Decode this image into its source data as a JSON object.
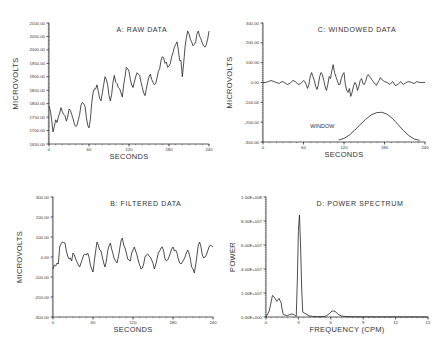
{
  "chart_data": [
    {
      "id": "A",
      "type": "line",
      "title": "A: RAW DATA",
      "xlabel": "SECONDS",
      "ylabel": "MICROVOLTS",
      "xlim": [
        0,
        240
      ],
      "ylim": [
        1650,
        2100
      ],
      "xticks": [
        0,
        60,
        120,
        180,
        240
      ],
      "xtick_labels": [
        "0",
        "60",
        "120",
        "180",
        "240"
      ],
      "yticks": [
        1650,
        1700,
        1750,
        1800,
        1850,
        1900,
        1950,
        2000,
        2050,
        2100
      ],
      "ytick_labels": [
        "1650.00",
        "1700.00",
        "1750.00",
        "1800.00",
        "1850.00",
        "1900.00",
        "1950.00",
        "2000.00",
        "2050.00",
        "2100.00"
      ],
      "grid": false,
      "series": [
        {
          "name": "raw",
          "x": [
            0,
            2,
            4,
            6,
            8,
            10,
            12,
            14,
            16,
            18,
            20,
            22,
            24,
            26,
            28,
            30,
            32,
            34,
            36,
            38,
            40,
            42,
            44,
            46,
            48,
            50,
            52,
            54,
            56,
            58,
            60,
            62,
            64,
            66,
            68,
            70,
            72,
            74,
            76,
            78,
            80,
            82,
            84,
            86,
            88,
            90,
            92,
            94,
            96,
            98,
            100,
            102,
            104,
            106,
            108,
            110,
            112,
            114,
            116,
            118,
            120,
            122,
            124,
            126,
            128,
            130,
            132,
            134,
            136,
            138,
            140,
            142,
            144,
            146,
            148,
            150,
            152,
            154,
            156,
            158,
            160,
            162,
            164,
            166,
            168,
            170,
            172,
            174,
            176,
            178,
            180,
            182,
            184,
            186,
            188,
            190,
            192,
            194,
            196,
            198,
            200,
            202,
            204,
            206,
            208,
            210,
            212,
            214,
            216,
            218,
            220,
            222,
            224,
            226,
            228,
            230,
            232,
            234,
            236,
            238,
            240
          ],
          "values": [
            1790,
            1775,
            1740,
            1695,
            1715,
            1740,
            1730,
            1750,
            1765,
            1785,
            1770,
            1760,
            1755,
            1735,
            1750,
            1780,
            1775,
            1760,
            1745,
            1725,
            1715,
            1720,
            1740,
            1760,
            1795,
            1805,
            1800,
            1790,
            1750,
            1720,
            1710,
            1740,
            1800,
            1840,
            1855,
            1855,
            1870,
            1845,
            1820,
            1810,
            1840,
            1870,
            1900,
            1890,
            1870,
            1830,
            1810,
            1835,
            1880,
            1905,
            1880,
            1875,
            1860,
            1855,
            1840,
            1825,
            1870,
            1900,
            1935,
            1930,
            1920,
            1890,
            1870,
            1860,
            1880,
            1900,
            1915,
            1910,
            1905,
            1880,
            1860,
            1840,
            1830,
            1855,
            1880,
            1900,
            1910,
            1890,
            1880,
            1870,
            1875,
            1895,
            1920,
            1930,
            1960,
            1975,
            1970,
            1950,
            1955,
            1935,
            1940,
            1950,
            1975,
            1990,
            2010,
            2020,
            2030,
            2000,
            1960,
            1960,
            1900,
            1950,
            2010,
            2045,
            2070,
            2060,
            2040,
            2030,
            2015,
            2020,
            2030,
            2060,
            2070,
            2050,
            2040,
            2025,
            2015,
            2010,
            2020,
            2040,
            2070
          ]
        }
      ]
    },
    {
      "id": "B",
      "type": "line",
      "title": "B: FILTERED DATA",
      "xlabel": "SECONDS",
      "ylabel": "MICROVOLTS",
      "xlim": [
        0,
        240
      ],
      "ylim": [
        -300,
        300
      ],
      "xticks": [
        0,
        60,
        120,
        180,
        240
      ],
      "xtick_labels": [
        "0",
        "60",
        "120",
        "180",
        "240"
      ],
      "yticks": [
        -300,
        -200,
        -100,
        0,
        100,
        200,
        300
      ],
      "ytick_labels": [
        "-300.00",
        "-200.00",
        "-100.00",
        "0.00",
        "100.00",
        "200.00",
        "300.00"
      ],
      "grid": false,
      "series": [
        {
          "name": "filtered",
          "x": [
            0,
            2,
            4,
            6,
            8,
            10,
            12,
            14,
            16,
            18,
            20,
            22,
            24,
            26,
            28,
            30,
            32,
            34,
            36,
            38,
            40,
            42,
            44,
            46,
            48,
            50,
            52,
            54,
            56,
            58,
            60,
            62,
            64,
            66,
            68,
            70,
            72,
            74,
            76,
            78,
            80,
            82,
            84,
            86,
            88,
            90,
            92,
            94,
            96,
            98,
            100,
            102,
            104,
            106,
            108,
            110,
            112,
            114,
            116,
            118,
            120,
            122,
            124,
            126,
            128,
            130,
            132,
            134,
            136,
            138,
            140,
            142,
            144,
            146,
            148,
            150,
            152,
            154,
            156,
            158,
            160,
            162,
            164,
            166,
            168,
            170,
            172,
            174,
            176,
            178,
            180,
            182,
            184,
            186,
            188,
            190,
            192,
            194,
            196,
            198,
            200,
            202,
            204,
            206,
            208,
            210,
            212,
            214,
            216,
            218,
            220,
            222,
            224,
            226,
            228,
            230,
            232,
            234,
            236,
            238,
            240
          ],
          "values": [
            -60,
            -40,
            -45,
            -30,
            -35,
            50,
            65,
            75,
            72,
            70,
            30,
            5,
            -10,
            -5,
            -20,
            20,
            10,
            -10,
            -25,
            -40,
            -50,
            -30,
            -10,
            10,
            15,
            10,
            20,
            0,
            -40,
            -60,
            -75,
            -20,
            30,
            75,
            60,
            35,
            30,
            0,
            -30,
            -50,
            -20,
            30,
            55,
            70,
            40,
            15,
            -10,
            -20,
            -30,
            0,
            40,
            80,
            95,
            60,
            45,
            20,
            -10,
            -15,
            -20,
            20,
            35,
            50,
            30,
            10,
            -20,
            -40,
            -60,
            -55,
            -35,
            0,
            10,
            15,
            5,
            0,
            -15,
            -30,
            -60,
            -40,
            -10,
            20,
            30,
            45,
            50,
            30,
            -10,
            -20,
            -15,
            0,
            20,
            40,
            50,
            30,
            35,
            20,
            -10,
            -30,
            -35,
            -25,
            -15,
            0,
            20,
            35,
            20,
            -10,
            -50,
            -60,
            -80,
            -40,
            10,
            60,
            75,
            50,
            10,
            -5,
            0,
            10,
            30,
            50,
            60,
            55,
            50,
            30,
            20
          ]
        }
      ]
    },
    {
      "id": "C",
      "type": "line",
      "title": "C: WINDOWED DATA",
      "xlabel": "SECONDS",
      "ylabel": "MICROVOLTS",
      "xlim": [
        0,
        240
      ],
      "ylim": [
        -300,
        300
      ],
      "xticks": [
        0,
        60,
        120,
        180,
        240
      ],
      "xtick_labels": [
        "0",
        "60",
        "120",
        "180",
        "240"
      ],
      "yticks": [
        -300,
        -200,
        -100,
        0,
        100,
        200,
        300
      ],
      "ytick_labels": [
        "-300.00",
        "-200.00",
        "-100.00",
        "0.00",
        "100.00",
        "200.00",
        "300.00"
      ],
      "grid": false,
      "annotations": [
        {
          "text": "WINDOW",
          "x": 70,
          "y": -228
        }
      ],
      "series": [
        {
          "name": "windowed",
          "x": [
            0,
            4,
            8,
            12,
            16,
            20,
            24,
            28,
            32,
            36,
            40,
            44,
            48,
            52,
            56,
            60,
            62,
            64,
            66,
            68,
            70,
            72,
            74,
            76,
            78,
            80,
            82,
            84,
            86,
            88,
            90,
            92,
            94,
            96,
            98,
            100,
            102,
            104,
            106,
            108,
            110,
            112,
            114,
            116,
            118,
            120,
            122,
            124,
            126,
            128,
            130,
            132,
            134,
            136,
            138,
            140,
            142,
            144,
            146,
            148,
            150,
            152,
            154,
            156,
            158,
            160,
            162,
            164,
            166,
            168,
            170,
            172,
            174,
            176,
            178,
            180,
            184,
            188,
            192,
            196,
            200,
            204,
            208,
            212,
            216,
            220,
            224,
            228,
            232,
            236,
            240
          ],
          "values": [
            0,
            0,
            5,
            10,
            5,
            0,
            -5,
            5,
            0,
            -10,
            -5,
            10,
            5,
            -10,
            -5,
            10,
            5,
            -10,
            -30,
            -10,
            30,
            50,
            30,
            10,
            -20,
            -35,
            -10,
            30,
            50,
            40,
            10,
            -20,
            -40,
            -10,
            30,
            20,
            60,
            90,
            50,
            30,
            10,
            -10,
            -10,
            20,
            40,
            50,
            -10,
            -40,
            -50,
            -30,
            -70,
            -50,
            -20,
            0,
            -10,
            -40,
            -20,
            10,
            20,
            -5,
            -10,
            5,
            30,
            40,
            30,
            20,
            10,
            0,
            -5,
            -15,
            0,
            10,
            25,
            15,
            10,
            5,
            0,
            -10,
            5,
            -15,
            -10,
            5,
            -10,
            0,
            5,
            0,
            -5,
            5,
            0,
            0,
            0
          ]
        },
        {
          "name": "window",
          "x": [
            112,
            120,
            128,
            136,
            144,
            152,
            160,
            168,
            176,
            184,
            192,
            200,
            208,
            216,
            224,
            232
          ],
          "values": [
            -290,
            -282,
            -265,
            -240,
            -212,
            -186,
            -164,
            -152,
            -150,
            -160,
            -182,
            -212,
            -242,
            -268,
            -285,
            -292
          ]
        }
      ]
    },
    {
      "id": "D",
      "type": "line",
      "title": "D: POWER SPECTRUM",
      "xlabel": "FREQUENCY (CPM)",
      "ylabel": "POWER",
      "xlim": [
        0,
        15
      ],
      "ylim": [
        0,
        100000000
      ],
      "xticks": [
        0,
        3,
        6,
        9,
        12,
        15
      ],
      "xtick_labels": [
        "0",
        "3",
        "6",
        "9",
        "12",
        "15"
      ],
      "yticks": [
        0,
        20000000,
        40000000,
        60000000,
        80000000,
        100000000
      ],
      "ytick_labels": [
        "0.00E+000",
        "2.00E+007",
        "4.00E+007",
        "6.00E+007",
        "8.00E+007",
        "1.00E+008"
      ],
      "grid": false,
      "series": [
        {
          "name": "power",
          "x": [
            0,
            0.3,
            0.6,
            0.8,
            1.0,
            1.2,
            1.4,
            1.5,
            1.6,
            1.8,
            2.0,
            2.2,
            2.4,
            2.6,
            2.7,
            2.8,
            2.9,
            3.0,
            3.1,
            3.2,
            3.3,
            3.4,
            3.6,
            3.8,
            4.0,
            4.3,
            4.6,
            5.0,
            5.5,
            5.9,
            6.1,
            6.3,
            6.5,
            6.7,
            7.0,
            7.5,
            8,
            9,
            10,
            11,
            12,
            13,
            14,
            15
          ],
          "values": [
            0,
            5000000,
            18000000,
            16000000,
            13000000,
            15500000,
            12000000,
            6000000,
            2000000,
            1500000,
            1200000,
            2000000,
            2500000,
            2000000,
            1000000,
            500000,
            30000000,
            72000000,
            85000000,
            60000000,
            25000000,
            4000000,
            3000000,
            2000000,
            1000000,
            500000,
            300000,
            200000,
            500000,
            3000000,
            5000000,
            5000000,
            4000000,
            2000000,
            800000,
            300000,
            200000,
            150000,
            100000,
            100000,
            100000,
            50000,
            50000,
            0
          ]
        }
      ]
    }
  ]
}
